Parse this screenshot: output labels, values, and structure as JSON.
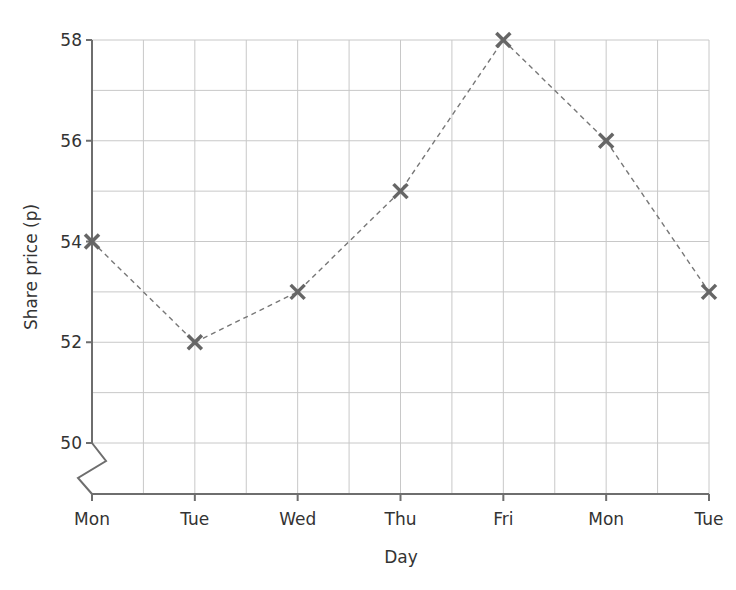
{
  "chart_data": {
    "type": "line",
    "title": "",
    "xlabel": "Day",
    "ylabel": "Share price (p)",
    "categories": [
      "Mon",
      "Tue",
      "Wed",
      "Thu",
      "Fri",
      "Mon",
      "Tue"
    ],
    "series": [
      {
        "name": "Share price",
        "values": [
          54,
          52,
          53,
          55,
          58,
          56,
          53
        ],
        "marker": "x",
        "line_style": "dashed",
        "color": "#666666"
      }
    ],
    "ylim": [
      49,
      58
    ],
    "y_ticks": [
      50,
      52,
      54,
      56,
      58
    ],
    "y_axis_break": true,
    "grid": true,
    "legend": null
  },
  "colors": {
    "axis": "#6e6e6e",
    "grid": "#c8c8c8",
    "marker": "#666666",
    "line": "#777777",
    "text": "#333333"
  },
  "labels": {
    "x_axis_title": "Day",
    "y_axis_title": "Share price (p)",
    "y_ticks": [
      "50",
      "52",
      "54",
      "56",
      "58"
    ],
    "x_ticks": [
      "Mon",
      "Tue",
      "Wed",
      "Thu",
      "Fri",
      "Mon",
      "Tue"
    ]
  }
}
